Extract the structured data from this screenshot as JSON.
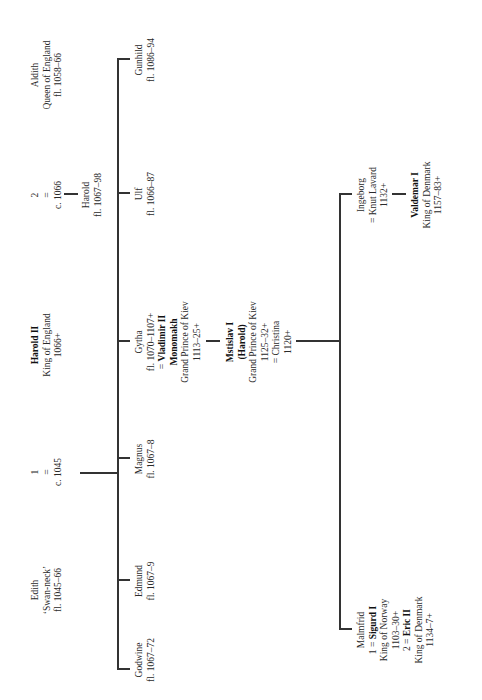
{
  "parents": {
    "edith": {
      "lines": [
        "Edith",
        "‘Swan-neck’",
        "fl. 1045–66"
      ]
    },
    "marriage1": {
      "lines": [
        "1",
        "=",
        "c. 1045"
      ]
    },
    "harold_ii": {
      "name": "Harold II",
      "lines": [
        "King of England",
        "1066+"
      ]
    },
    "marriage2": {
      "lines": [
        "2",
        "=",
        "c. 1066"
      ]
    },
    "aldith": {
      "lines": [
        "Aldith",
        "Queen of England",
        "fl. 1058–66"
      ]
    }
  },
  "children_first_marriage": [
    {
      "name": "Godwine",
      "dates": "fl. 1067–72"
    },
    {
      "name": "Edmund",
      "dates": "fl. 1067–9"
    },
    {
      "name": "Magnus",
      "dates": "fl. 1067–8"
    },
    {
      "name": "Gytha",
      "dates": "fl. 1070–1107+",
      "spouse_prefix": "= ",
      "spouse_bold": "Vladimir II",
      "spouse_bold2": "Monomakh",
      "spouse_title": "Grand Prince of Kiev",
      "spouse_dates": "1113–25+"
    },
    {
      "name": "Ulf",
      "dates": "fl. 1066–87"
    },
    {
      "name": "Gunhild",
      "dates": "fl. 1086–94"
    }
  ],
  "child_second_marriage": {
    "name": "Harold",
    "dates": "fl. 1067–98"
  },
  "mstislav": {
    "name_bold": "Mstislav I",
    "name_bold2": "(Harold)",
    "title": "Grand Prince of Kiev",
    "dates": "1125–32+",
    "spouse": "= Christina",
    "spouse_dates": "1120+"
  },
  "malmfrid": {
    "name": "Malmfrid",
    "m1_prefix": "1 = ",
    "m1_bold": "Sigurd I",
    "m1_title": "King of Norway",
    "m1_dates": "1103–30+",
    "m2_prefix": "2 = ",
    "m2_bold": "Eric II",
    "m2_title": "King of Denmark",
    "m2_dates": "1134–7+"
  },
  "ingeborg": {
    "name": "Ingeborg",
    "spouse": "= Knut Lavard",
    "spouse_dates": "1132+"
  },
  "valdemar": {
    "name_bold": "Valdemar I",
    "title": "King of Denmark",
    "dates": "1157–83+"
  }
}
